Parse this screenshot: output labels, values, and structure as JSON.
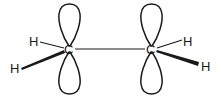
{
  "diagram": {
    "type": "molecular-orbital-sketch",
    "atoms": {
      "c1": "C",
      "c2": "C",
      "h1": "H",
      "h2": "H",
      "h3": "H",
      "h4": "H"
    },
    "colors": {
      "ink": "#1a1a1a",
      "background": "#ffffff"
    }
  }
}
